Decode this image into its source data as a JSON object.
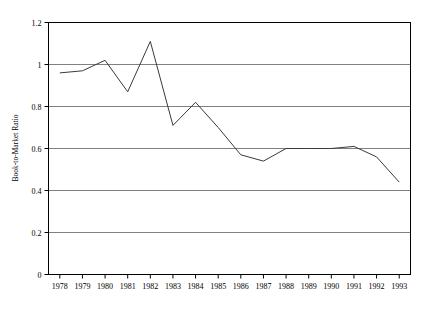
{
  "chart_data": {
    "type": "line",
    "title": "",
    "xlabel": "",
    "ylabel": "Book-to-Market Ratio",
    "categories": [
      "1978",
      "1979",
      "1980",
      "1981",
      "1982",
      "1983",
      "1984",
      "1985",
      "1986",
      "1987",
      "1988",
      "1989",
      "1990",
      "1991",
      "1992",
      "1993"
    ],
    "values": [
      0.96,
      0.97,
      1.02,
      0.87,
      1.11,
      0.71,
      0.82,
      0.7,
      0.57,
      0.54,
      0.6,
      0.6,
      0.6,
      0.61,
      0.56,
      0.44
    ],
    "ylim": [
      0,
      1.2
    ],
    "yticks": [
      "0",
      "0.2",
      "0.4",
      "0.6",
      "0.8",
      "1",
      "1.2"
    ],
    "ytick_values": [
      0,
      0.2,
      0.4,
      0.6,
      0.8,
      1.0,
      1.2
    ],
    "xticks": [
      "1978",
      "1979",
      "1980",
      "1981",
      "1982",
      "1983",
      "1984",
      "1985",
      "1986",
      "1987",
      "1988",
      "1989",
      "1990",
      "1991",
      "1992",
      "1993"
    ],
    "grid": "horizontal",
    "legend": "none",
    "series": [
      {
        "name": "Book-to-Market Ratio",
        "values": [
          0.96,
          0.97,
          1.02,
          0.87,
          1.11,
          0.71,
          0.82,
          0.7,
          0.57,
          0.54,
          0.6,
          0.6,
          0.6,
          0.61,
          0.56,
          0.44
        ],
        "color": "#3a3a3a"
      }
    ],
    "line_color": "#3a3a3a",
    "axis_color": "#000000",
    "grid_color": "#808080",
    "background": "#ffffff"
  }
}
